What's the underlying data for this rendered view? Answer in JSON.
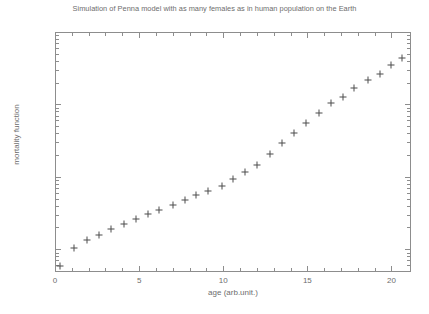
{
  "chart_data": {
    "type": "scatter",
    "title": "Simulation of Penna model with as many females as in human population on the Earth",
    "xlabel": "age (arb.unit.)",
    "ylabel": "mortality function",
    "xlim": [
      0,
      21.1
    ],
    "ylim": [
      0.005,
      10
    ],
    "yscale": "log",
    "xscale": "linear",
    "grid": false,
    "legend": null,
    "marker": "plus",
    "marker_color": "#4c4c4c",
    "xticks": [
      0,
      5,
      10,
      15,
      20
    ],
    "xtick_labels": [
      "0",
      "5",
      "10",
      "15",
      "20"
    ],
    "yticks": [
      10,
      1,
      0.1,
      0.01
    ],
    "ytick_labels": [
      "10",
      "1",
      "0.1",
      "0.01"
    ],
    "x": [
      0.3,
      1.1,
      1.9,
      2.6,
      3.3,
      4.1,
      4.8,
      5.5,
      6.2,
      7.0,
      7.7,
      8.4,
      9.1,
      9.9,
      10.6,
      11.3,
      12.0,
      12.8,
      13.5,
      14.2,
      14.9,
      15.7,
      16.4,
      17.1,
      17.8,
      18.6,
      19.3,
      20.0,
      20.6
    ],
    "y": [
      0.0058,
      0.0103,
      0.0135,
      0.0159,
      0.0188,
      0.0226,
      0.0262,
      0.0304,
      0.035,
      0.041,
      0.0475,
      0.0553,
      0.0645,
      0.0752,
      0.0933,
      0.118,
      0.144,
      0.208,
      0.292,
      0.406,
      0.547,
      0.765,
      1.03,
      1.28,
      1.67,
      2.15,
      2.65,
      3.45,
      4.4
    ]
  },
  "figure": {
    "background": "#ffffff",
    "axis_color": "#8d8d8d",
    "text_color": "#6d6d6d"
  }
}
